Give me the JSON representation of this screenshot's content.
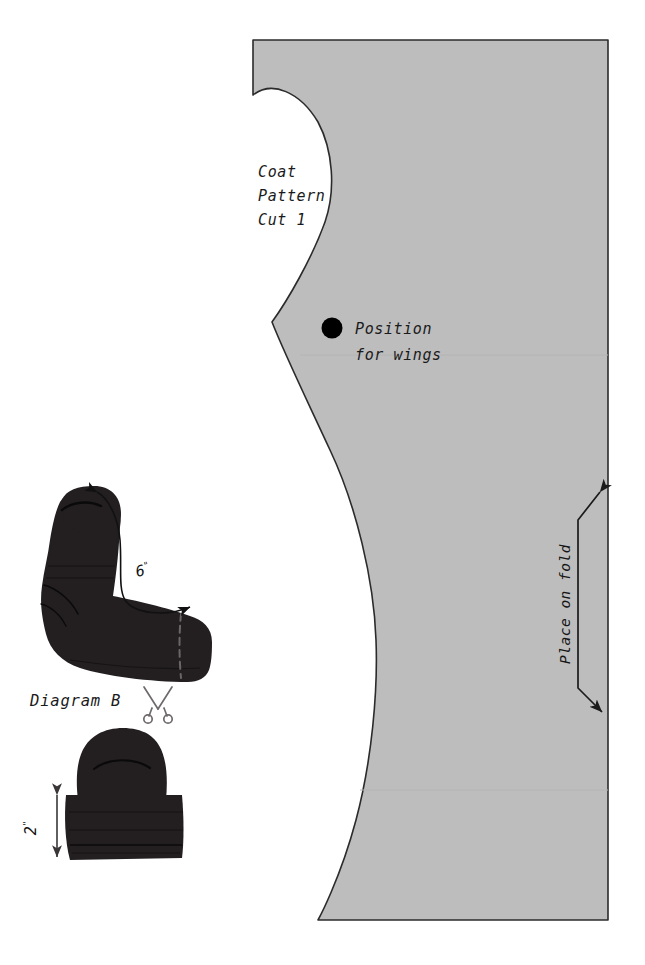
{
  "document": {
    "type": "sewing-pattern-sheet",
    "background_color": "#ffffff"
  },
  "coat_pattern": {
    "fill_color": "#bdbdbd",
    "outline_color": "#2b2b2b",
    "title_line_1": "Coat",
    "title_line_2": "Pattern",
    "title_line_3": "Cut 1",
    "marker_label_line_1": "Position",
    "marker_label_line_2": "for wings",
    "marker_color": "#000000",
    "fold_label": "Place on fold"
  },
  "sock_figure": {
    "caption": "Diagram B",
    "dimension_label": "6",
    "dimension_unit": "\"",
    "fill_color": "#231f20",
    "cut_icon": "scissors-icon"
  },
  "hat_figure": {
    "dimension_label": "2",
    "dimension_unit": "\"",
    "fill_color": "#231f20"
  }
}
